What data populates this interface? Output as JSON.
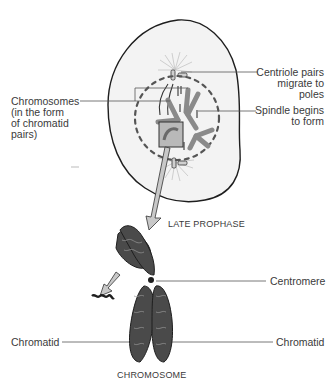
{
  "diagram": {
    "type": "biology-illustration"
  },
  "labels": {
    "centriole": "Centriole pairs\nmigrate to poles",
    "spindle": "Spindle begins\nto form",
    "chromosomes": "Chromosomes\n(in the form\nof chromatid\npairs)",
    "stage_caption": "LATE PROPHASE",
    "centromere": "Centromere",
    "chromatid_left": "Chromatid",
    "chromatid_right": "Chromatid",
    "chromosome_caption": "CHROMOSOME"
  },
  "colors": {
    "cell_fill": "#f3f3f3",
    "outline": "#1e1e1e",
    "chromosome_grey": "#8a8a8a",
    "callout_box": "#b9b9b9",
    "arrow_fill": "#c8c8c8",
    "chromatin": "#3a3a3a",
    "leader_line": "#555555"
  }
}
